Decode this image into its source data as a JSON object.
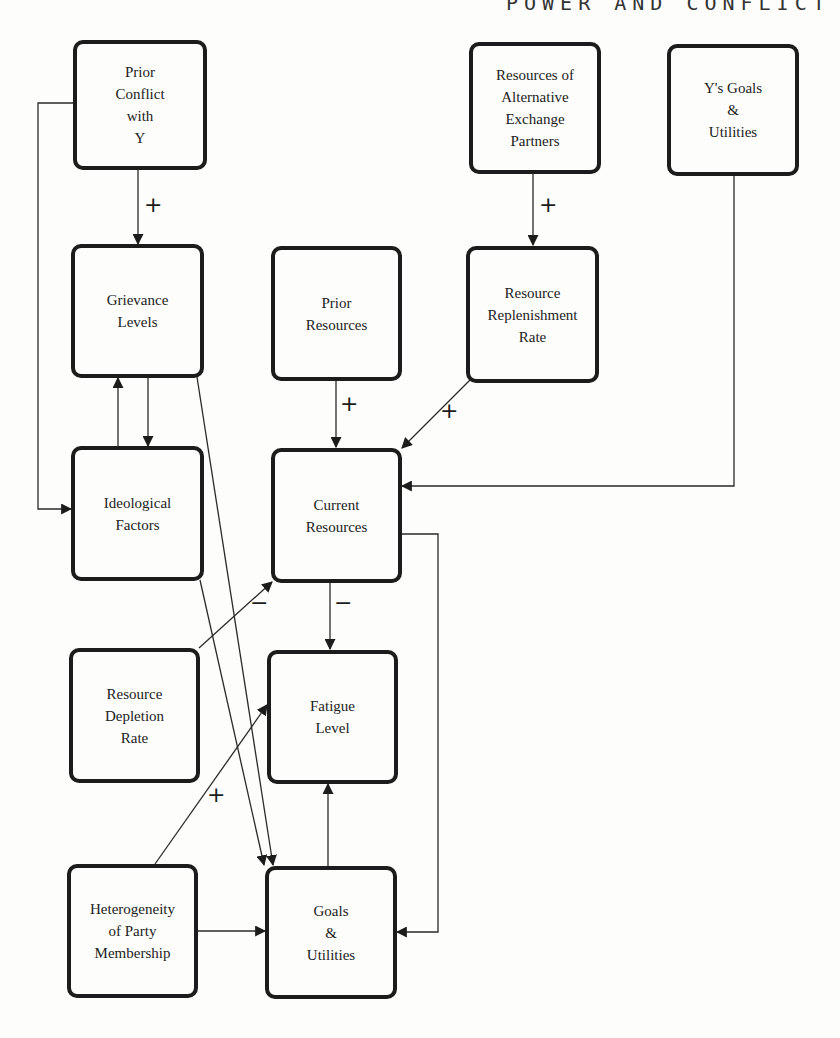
{
  "header": {
    "running_title": "POWER AND CONFLICT"
  },
  "nodes": {
    "prior_conflict": "Prior\nConflict\nwith\nY",
    "alt_partners": "Resources of\nAlternative\nExchange\nPartners",
    "y_goals": "Y's Goals\n&\nUtilities",
    "grievance": "Grievance\nLevels",
    "prior_resources": "Prior\nResources",
    "replenishment": "Resource\nReplenishment\nRate",
    "ideological": "Ideological\nFactors",
    "current_resources": "Current\nResources",
    "depletion": "Resource\nDepletion\nRate",
    "fatigue": "Fatigue\nLevel",
    "heterogeneity": "Heterogeneity\nof Party\nMembership",
    "goals": "Goals\n&\nUtilities"
  },
  "edges": [
    {
      "from": "Prior Conflict with Y",
      "to": "Grievance Levels",
      "sign": "+"
    },
    {
      "from": "Prior Conflict with Y",
      "to": "Ideological Factors",
      "sign": ""
    },
    {
      "from": "Resources of Alternative Exchange Partners",
      "to": "Resource Replenishment Rate",
      "sign": "+"
    },
    {
      "from": "Y's Goals & Utilities",
      "to": "Current Resources",
      "sign": ""
    },
    {
      "from": "Grievance Levels",
      "to": "Ideological Factors",
      "sign": ""
    },
    {
      "from": "Ideological Factors",
      "to": "Grievance Levels",
      "sign": ""
    },
    {
      "from": "Grievance Levels",
      "to": "Goals & Utilities",
      "sign": ""
    },
    {
      "from": "Ideological Factors",
      "to": "Goals & Utilities",
      "sign": ""
    },
    {
      "from": "Prior Resources",
      "to": "Current Resources",
      "sign": "+"
    },
    {
      "from": "Resource Replenishment Rate",
      "to": "Current Resources",
      "sign": "+"
    },
    {
      "from": "Resource Depletion Rate",
      "to": "Current Resources",
      "sign": "−"
    },
    {
      "from": "Current Resources",
      "to": "Fatigue Level",
      "sign": "−"
    },
    {
      "from": "Current Resources",
      "to": "Goals & Utilities",
      "sign": ""
    },
    {
      "from": "Heterogeneity of Party Membership",
      "to": "Fatigue Level",
      "sign": "+"
    },
    {
      "from": "Heterogeneity of Party Membership",
      "to": "Goals & Utilities",
      "sign": ""
    },
    {
      "from": "Goals & Utilities",
      "to": "Fatigue Level",
      "sign": ""
    }
  ],
  "signs": {
    "conflict_grievance": "+",
    "alt_replenish": "+",
    "prior_current": "+",
    "replenish_current": "+",
    "depletion_current": "−",
    "current_fatigue": "−",
    "hetero_fatigue": "+"
  }
}
